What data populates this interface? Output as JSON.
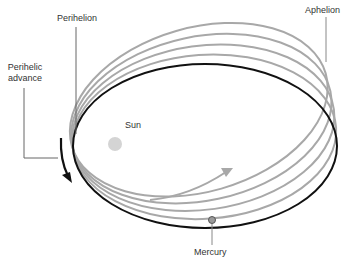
{
  "labels": {
    "perihelion": "Perihelion",
    "aphelion": "Aphelion",
    "perihelic_advance_line1": "Perihelic",
    "perihelic_advance_line2": "advance",
    "sun": "Sun",
    "mercury": "Mercury"
  },
  "colors": {
    "current_orbit": "#111111",
    "past_orbits": "#a8a8a8",
    "sun": "#d4d4d4",
    "mercury": "#9a9a9a",
    "leader_line": "#888888",
    "advance_arrow": "#111111",
    "orbit_direction_arrow": "#a8a8a8"
  },
  "orbits": {
    "count": 5,
    "rotation_degrees": [
      0,
      -4,
      -8,
      -12,
      -16
    ]
  }
}
